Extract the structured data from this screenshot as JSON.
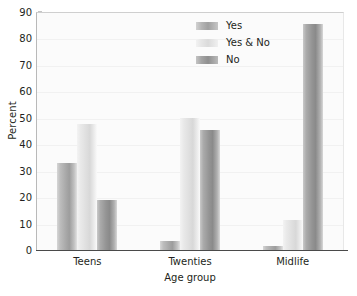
{
  "chart_data": {
    "type": "bar",
    "title": "",
    "subtitle": "",
    "xlabel": "Age group",
    "ylabel": "Percent",
    "categories": [
      "Teens",
      "Twenties",
      "Midlife"
    ],
    "series": [
      {
        "name": "Yes",
        "values": [
          33.0,
          3.5,
          1.5
        ]
      },
      {
        "name": "Yes & No",
        "values": [
          47.5,
          50.0,
          11.5
        ]
      },
      {
        "name": "No",
        "values": [
          19.0,
          45.5,
          85.5
        ]
      }
    ],
    "ylim": [
      0,
      90
    ],
    "yticks": [
      0,
      10,
      20,
      30,
      40,
      50,
      60,
      70,
      80,
      90
    ],
    "ytick_labels": [
      "0",
      "10",
      "20",
      "30",
      "40",
      "50",
      "60",
      "70",
      "80",
      "90"
    ],
    "grid": true,
    "grid_axis": "y",
    "legend_position": "top-right",
    "legend_entries": [
      "Yes",
      "Yes & No",
      "No"
    ],
    "colors": {
      "Yes": "#a8a8a8",
      "Yes & No": "#dedede",
      "No": "#949494",
      "plot_background": "#fbfbfb",
      "gridline": "#f1f1f1",
      "axis": "#4a4a4a",
      "text": "#231f20"
    }
  }
}
